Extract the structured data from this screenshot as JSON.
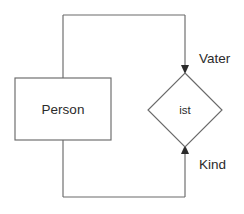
{
  "diagram": {
    "type": "er-diagram",
    "notation": "chen",
    "background_color": "#ffffff",
    "stroke_color": "#6a6a6a",
    "text_color": "#2b2b2b",
    "entities": [
      {
        "id": "person",
        "label": "Person",
        "shape": "rectangle",
        "x": 15,
        "y": 78,
        "width": 96,
        "height": 62
      }
    ],
    "relationships": [
      {
        "id": "ist",
        "label": "ist",
        "shape": "diamond",
        "center_x": 185,
        "center_y": 110,
        "half_width": 37,
        "half_height": 37
      }
    ],
    "roles": [
      {
        "id": "vater",
        "label": "Vater",
        "x": 199,
        "y": 59,
        "direction": "into-relationship",
        "arrow": "down"
      },
      {
        "id": "kind",
        "label": "Kind",
        "x": 199,
        "y": 165,
        "direction": "into-relationship",
        "arrow": "up"
      }
    ],
    "connectors": [
      {
        "id": "top-edge",
        "from": "person-top",
        "to": "ist-top",
        "path": "M 63 15 L 185 15"
      },
      {
        "id": "left-spine",
        "from": "person",
        "to": "person",
        "path": "M 63 15 L 63 197"
      },
      {
        "id": "bottom-edge",
        "from": "person-bottom",
        "to": "ist-bottom",
        "path": "M 63 197 L 185 197"
      },
      {
        "id": "vater-drop",
        "from": "top-edge",
        "to": "ist-top",
        "path": "M 185 15 L 185 72"
      },
      {
        "id": "kind-rise",
        "from": "bottom-edge",
        "to": "ist-bottom",
        "path": "M 185 197 L 185 147"
      }
    ]
  }
}
